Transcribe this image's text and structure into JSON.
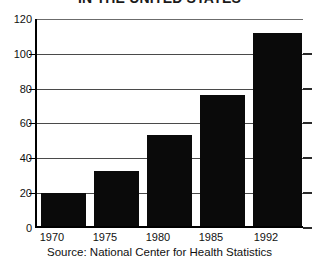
{
  "chart_data": {
    "type": "bar",
    "title": "IN THE UNITED STATES",
    "categories": [
      "1970",
      "1975",
      "1980",
      "1985",
      "1992"
    ],
    "values": [
      19,
      32,
      53,
      76,
      112
    ],
    "xlabel": "",
    "ylabel": "",
    "ylim": [
      0,
      120
    ],
    "yticks": [
      0,
      20,
      40,
      60,
      80,
      100,
      120
    ],
    "grid": true,
    "legend": "none",
    "bar_color": "#0a0a0a",
    "background_color": "#ffffff",
    "source": "Source: National Center for Health Statistics"
  }
}
